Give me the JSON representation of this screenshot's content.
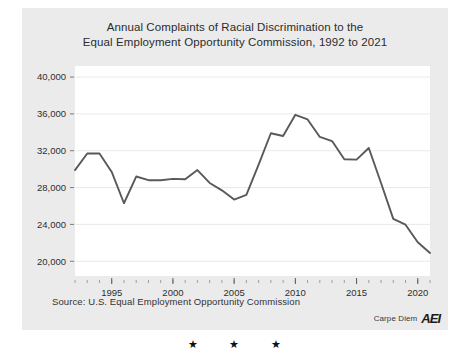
{
  "page": {
    "background_color": "#ffffff",
    "card_color": "#ebebeb",
    "plot_background": "#ffffff",
    "line_color": "#595959",
    "stars": "★ ★ ★"
  },
  "chart": {
    "title_line1": "Annual Complaints of Racial Discrimination to the",
    "title_line2": "Equal Employment Opportunity Commission, 1992 to 2021",
    "source": "Source: U.S. Equal Employment Opportunity Commission",
    "brand_text": "Carpe Diem",
    "brand_logo": "AEI"
  },
  "chart_data": {
    "type": "line",
    "title": "Annual Complaints of Racial Discrimination to the Equal Employment Opportunity Commission, 1992 to 2021",
    "xlabel": "",
    "ylabel": "",
    "xlim": [
      1992,
      2021
    ],
    "ylim": [
      18400,
      41200
    ],
    "grid": true,
    "legend": "none",
    "ytick_labels": [
      "20,000",
      "24,000",
      "28,000",
      "32,000",
      "36,000",
      "40,000"
    ],
    "yticks": [
      20000,
      24000,
      28000,
      32000,
      36000,
      40000
    ],
    "xtick_labels": [
      "1995",
      "2000",
      "2005",
      "2010",
      "2015",
      "2020"
    ],
    "xticks": [
      1995,
      2000,
      2005,
      2010,
      2015,
      2020
    ],
    "x_minor_tick_step": 1,
    "x": [
      1992,
      1993,
      1994,
      1995,
      1996,
      1997,
      1998,
      1999,
      2000,
      2001,
      2002,
      2003,
      2004,
      2005,
      2006,
      2007,
      2008,
      2009,
      2010,
      2011,
      2012,
      2013,
      2014,
      2015,
      2016,
      2017,
      2018,
      2019,
      2020,
      2021
    ],
    "values": [
      29900,
      31700,
      31700,
      29700,
      26300,
      29200,
      28800,
      28800,
      28950,
      28900,
      29900,
      28500,
      27700,
      26700,
      27200,
      30500,
      33900,
      33600,
      35900,
      35400,
      33500,
      33050,
      31070,
      31030,
      32300,
      28500,
      24600,
      23970,
      22060,
      20900
    ],
    "series": [
      {
        "name": "Racial discrimination complaints",
        "values": [
          29900,
          31700,
          31700,
          29700,
          26300,
          29200,
          28800,
          28800,
          28950,
          28900,
          29900,
          28500,
          27700,
          26700,
          27200,
          30500,
          33900,
          33600,
          35900,
          35400,
          33500,
          33050,
          31070,
          31030,
          32300,
          28500,
          24600,
          23970,
          22060,
          20900
        ]
      }
    ]
  }
}
